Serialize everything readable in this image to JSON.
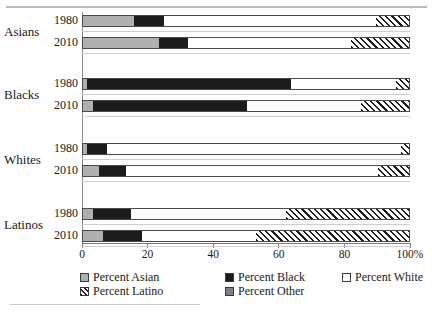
{
  "chart_data": {
    "type": "bar",
    "orientation": "horizontal",
    "stacked": true,
    "title": "",
    "xlabel": "",
    "ylabel": "",
    "xlim": [
      0,
      100
    ],
    "xticks": [
      0,
      20,
      40,
      60,
      80,
      100
    ],
    "xtick_labels": [
      "0",
      "20",
      "40",
      "60",
      "80",
      "100%"
    ],
    "grid": false,
    "legend_position": "bottom",
    "series": [
      {
        "name": "Percent Asian",
        "key": "asian",
        "color": "#b0b0b0",
        "pattern": "solid"
      },
      {
        "name": "Percent Black",
        "key": "black",
        "color": "#1c1c1c",
        "pattern": "solid"
      },
      {
        "name": "Percent White",
        "key": "white",
        "color": "#ffffff",
        "pattern": "solid"
      },
      {
        "name": "Percent Latino",
        "key": "latino",
        "color": "#1c1c1c",
        "pattern": "diagonal-hatch"
      },
      {
        "name": "Percent Other",
        "key": "other",
        "color": "#808080",
        "pattern": "solid"
      }
    ],
    "groups": [
      {
        "label": "Asians",
        "rows": [
          {
            "year": "1980",
            "asian": 15.5,
            "black": 9.2,
            "white": 64.6,
            "latino": 10.7,
            "other": 0.0
          },
          {
            "year": "2010",
            "asian": 23.2,
            "black": 8.8,
            "white": 49.7,
            "latino": 18.3,
            "other": 0.0
          }
        ]
      },
      {
        "label": "Blacks",
        "rows": [
          {
            "year": "1980",
            "asian": 1.2,
            "black": 62.2,
            "white": 32.0,
            "latino": 4.6,
            "other": 0.0
          },
          {
            "year": "2010",
            "asian": 3.0,
            "black": 47.0,
            "white": 34.8,
            "latino": 15.2,
            "other": 0.0
          }
        ]
      },
      {
        "label": "Whites",
        "rows": [
          {
            "year": "1980",
            "asian": 1.2,
            "black": 6.1,
            "white": 89.7,
            "latino": 3.0,
            "other": 0.0
          },
          {
            "year": "2010",
            "asian": 4.9,
            "black": 8.2,
            "white": 76.9,
            "latino": 10.0,
            "other": 0.0
          }
        ]
      },
      {
        "label": "Latinos",
        "rows": [
          {
            "year": "1980",
            "asian": 3.0,
            "black": 11.6,
            "white": 47.3,
            "latino": 38.1,
            "other": 0.0
          },
          {
            "year": "2010",
            "asian": 6.1,
            "black": 11.9,
            "white": 34.8,
            "latino": 47.2,
            "other": 0.0
          }
        ]
      }
    ]
  },
  "axis": {
    "ticks": [
      {
        "value": 0,
        "label": "0"
      },
      {
        "value": 20,
        "label": "20"
      },
      {
        "value": 40,
        "label": "40"
      },
      {
        "value": 60,
        "label": "60"
      },
      {
        "value": 80,
        "label": "80"
      },
      {
        "value": 100,
        "label": "100%"
      }
    ]
  },
  "legend": {
    "items": [
      {
        "label": "Percent Asian",
        "swatch": "sw-asian",
        "col": 0,
        "row": 0
      },
      {
        "label": "Percent Black",
        "swatch": "sw-black",
        "col": 1,
        "row": 0
      },
      {
        "label": "Percent White",
        "swatch": "sw-white",
        "col": 2,
        "row": 0
      },
      {
        "label": "Percent Latino",
        "swatch": "sw-latino",
        "col": 0,
        "row": 1
      },
      {
        "label": "Percent Other",
        "swatch": "sw-other",
        "col": 1,
        "row": 1
      }
    ]
  }
}
